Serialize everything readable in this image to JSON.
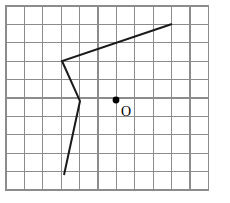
{
  "figure": {
    "canvas": {
      "width": 230,
      "height": 203,
      "background": "#ffffff"
    },
    "grid": {
      "x0": 6,
      "y0": 6,
      "columns": 11,
      "rows": 10,
      "cell_width": 18.4,
      "cell_height": 18.4,
      "line_color": "#8c8c8c",
      "border_color": "#8c8c8c",
      "visible": true
    },
    "polyline": {
      "name": "zigzag-polyline",
      "color": "#1a1a1a",
      "stroke_width": 2,
      "closed": false,
      "points": [
        {
          "x": 172,
          "y": 24
        },
        {
          "x": 62,
          "y": 61
        },
        {
          "x": 80,
          "y": 101
        },
        {
          "x": 64,
          "y": 175
        }
      ],
      "points_text": "(172,24) (62,61) (80,101) (64,175)"
    },
    "point": {
      "name": "center-point",
      "label": "O",
      "dot_x": 116,
      "dot_y": 100,
      "dot_radius": 3.4,
      "label_x": 121,
      "label_y": 116,
      "color": "#000000"
    }
  }
}
